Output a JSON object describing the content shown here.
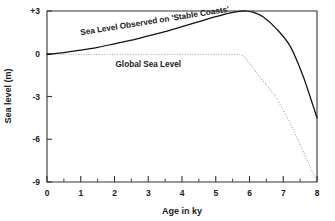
{
  "chart_data": {
    "type": "line",
    "title": "",
    "xlabel": "Age in ky",
    "ylabel": "Sea level (m)",
    "xlim": [
      0,
      8
    ],
    "ylim": [
      -9,
      3
    ],
    "grid": false,
    "legend_position": "inline-annotations",
    "x_ticks": [
      "0",
      "1",
      "2",
      "3",
      "4",
      "5",
      "6",
      "7",
      "8"
    ],
    "x_tick_values": [
      0,
      1,
      2,
      3,
      4,
      5,
      6,
      7,
      8
    ],
    "x_minor_step": 0.5,
    "y_ticks": [
      "+3",
      "0",
      "-3",
      "-6",
      "-9"
    ],
    "y_tick_values": [
      3,
      0,
      -3,
      -6,
      -9
    ],
    "series": [
      {
        "name": "Sea Level Observed on 'Stable Coasts'",
        "style": "solid",
        "color": "#111111",
        "x": [
          0.0,
          0.5,
          1.0,
          1.5,
          2.0,
          2.5,
          3.0,
          3.5,
          4.0,
          4.5,
          5.0,
          5.4,
          5.7,
          5.9,
          6.1,
          6.4,
          6.8,
          7.2,
          7.6,
          8.0
        ],
        "values": [
          -0.05,
          0.08,
          0.25,
          0.45,
          0.7,
          0.95,
          1.25,
          1.55,
          1.9,
          2.25,
          2.6,
          2.85,
          2.98,
          3.0,
          2.92,
          2.6,
          1.75,
          0.55,
          -1.65,
          -4.5
        ]
      },
      {
        "name": "Global Sea Level",
        "style": "dotted",
        "color": "#9a9a9a",
        "x": [
          0.0,
          1.0,
          2.0,
          3.0,
          4.0,
          5.0,
          5.5,
          5.7,
          5.85,
          6.2,
          6.5,
          6.8,
          7.2,
          7.6,
          8.0
        ],
        "values": [
          -0.05,
          -0.05,
          -0.05,
          -0.05,
          -0.05,
          -0.05,
          -0.05,
          -0.05,
          -0.2,
          -1.3,
          -2.2,
          -3.1,
          -4.85,
          -6.9,
          -9.0
        ]
      }
    ],
    "annotations": [
      {
        "text": "Sea Level Observed on 'Stable Coasts'",
        "x": 1.0,
        "y": 1.3,
        "rotation": -9
      },
      {
        "text": "Global Sea Level",
        "x": 3.0,
        "y": -0.9,
        "rotation": 0
      }
    ],
    "colors": {
      "observed_curve": "#111111",
      "global_curve": "#9a9a9a",
      "axis": "#333333",
      "background": "#ffffff"
    }
  }
}
